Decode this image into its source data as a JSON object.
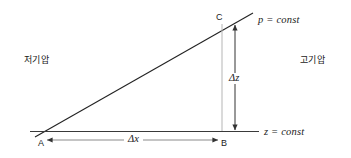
{
  "diagram": {
    "colors": {
      "line": "#222222",
      "guide": "#9a9a9a",
      "arrow": "#333333",
      "text": "#1a1a1a",
      "background": "#ffffff"
    },
    "labels": {
      "pressure_surface": "p = const",
      "height_surface": "z = const",
      "low_pressure": "저기압",
      "high_pressure": "고기압",
      "delta_z": "Δz",
      "delta_x": "Δx",
      "point_a": "A",
      "point_b": "B",
      "point_c": "C"
    }
  }
}
